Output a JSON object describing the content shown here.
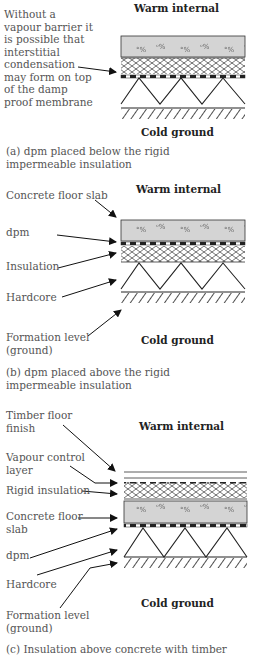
{
  "panel_a": {
    "heading_top": "Warm internal",
    "heading_bottom": "Cold ground",
    "note": "Without a\nvapour barrier it\nis possible that\ninterstitial\ncondensation\nmay form on top\nof the damp\nproof membrane",
    "caption": "(a) dpm placed below the rigid\n      impermeable insulation"
  },
  "panel_b": {
    "heading_top": "Warm internal",
    "heading_bottom": "Cold ground",
    "labels": [
      "Concrete floor slab",
      "dpm",
      "Insulation",
      "Hardcore",
      "Formation level\n(ground)"
    ],
    "caption": "(b) dpm placed above the rigid\n      impermeable insulation"
  },
  "panel_c": {
    "heading_top": "Warm internal",
    "heading_bottom": "Cold ground",
    "labels": [
      "Timber floor\nfinish",
      "Vapour control\nlayer",
      "Rigid insulation",
      "Concrete floor\nslab",
      "dpm",
      "Hardcore",
      "Formation level\n(ground)"
    ],
    "caption": "(c) Insulation above concrete with timber"
  },
  "colors": {
    "concrete": "#d4d4d4",
    "line": "#222222"
  }
}
